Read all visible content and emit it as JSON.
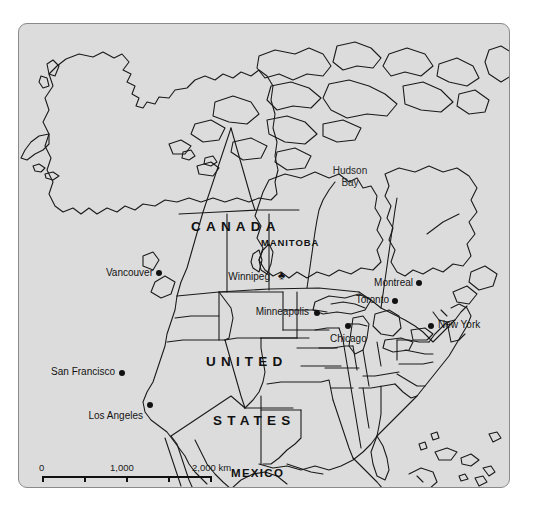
{
  "map": {
    "title": "North America reference map",
    "background_color": "#ffffff",
    "land_fill": "#dcdcdc",
    "border_color": "#8a8a8a",
    "outline_color": "#1a1a1a",
    "countries": [
      {
        "id": "canada",
        "label": "CANADA",
        "style": "major",
        "x": 190,
        "y": 204
      },
      {
        "id": "united",
        "label": "UNITED",
        "style": "major",
        "x": 205,
        "y": 339
      },
      {
        "id": "states",
        "label": "STATES",
        "style": "major",
        "x": 212,
        "y": 398
      },
      {
        "id": "mexico",
        "label": "MEXICO",
        "style": "mid",
        "x": 230,
        "y": 472
      }
    ],
    "provinces": [
      {
        "id": "manitoba",
        "label": "MANITOBA",
        "x": 260,
        "y": 222
      }
    ],
    "water_bodies": [
      {
        "id": "hudson-bay",
        "label": "Hudson\nBay",
        "line1": "Hudson",
        "line2": "Bay",
        "x": 331,
        "y": 171
      }
    ],
    "cities": [
      {
        "id": "vancouver",
        "label": "Vancouver",
        "x": 158,
        "y": 271,
        "anchor": "right",
        "capital": false
      },
      {
        "id": "winnipeg",
        "label": "Winnipeg",
        "x": 283,
        "y": 275,
        "anchor": "right",
        "capital": true
      },
      {
        "id": "montreal",
        "label": "Montreal",
        "x": 419,
        "y": 282,
        "anchor": "right",
        "capital": false
      },
      {
        "id": "toronto",
        "label": "Toronto",
        "x": 395,
        "y": 299,
        "anchor": "right",
        "capital": false
      },
      {
        "id": "minneapolis",
        "label": "Minneapolis",
        "x": 317,
        "y": 311,
        "anchor": "right",
        "capital": false
      },
      {
        "id": "chicago",
        "label": "Chicago",
        "x": 348,
        "y": 327,
        "anchor": "center-below",
        "capital": false
      },
      {
        "id": "new-york",
        "label": "New York",
        "x": 432,
        "y": 325,
        "anchor": "left",
        "capital": false
      },
      {
        "id": "san-francisco",
        "label": "San Francisco",
        "x": 122,
        "y": 371,
        "anchor": "right",
        "capital": false
      },
      {
        "id": "los-angeles",
        "label": "Los Angeles",
        "x": 150,
        "y": 406,
        "anchor": "right",
        "capital": false
      }
    ],
    "scale_bar": {
      "labels": [
        "0",
        "1,000",
        "2,000 km"
      ],
      "unit": "km",
      "max_value": 2000,
      "segments": 4
    }
  }
}
